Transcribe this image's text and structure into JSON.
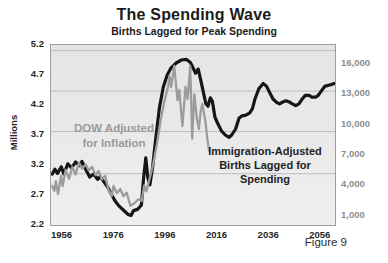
{
  "header": {
    "title": "The Spending Wave",
    "subtitle": "Births Lagged for Peak Spending"
  },
  "figure_label": "Figure 9",
  "annotations": {
    "dow_label": "DOW Adjusted for Inflation",
    "births_label": "Immigration-Adjusted Births Lagged for Spending"
  },
  "colors": {
    "births_line": "#161616",
    "dow_line": "#9c9c9c",
    "plot_background": "#e9e9e9",
    "gridline": "#bcbcbc",
    "right_axis_text": "#8c8c8c",
    "axis_text": "#262626"
  },
  "chart_data": {
    "type": "line",
    "title": "The Spending Wave",
    "subtitle": "Births Lagged for Peak Spending",
    "x_range": [
      1951.5,
      2061.5
    ],
    "x_ticks": [
      "1956",
      "1976",
      "1996",
      "2016",
      "2036",
      "2056"
    ],
    "x_tick_years": [
      1956,
      1976,
      1996,
      2016,
      2036,
      2056
    ],
    "y_left": {
      "label": "Millions",
      "range": [
        2.2,
        5.2
      ],
      "ticks": [
        "5.2",
        "4.7",
        "4.2",
        "3.7",
        "3.2",
        "2.7",
        "2.2"
      ]
    },
    "y_right": {
      "ticks": [
        "16,000",
        "13,000",
        "10,000",
        "7,000",
        "4,000",
        "1,000"
      ]
    },
    "grid_fractions": [
      0.031,
      0.256,
      0.481,
      0.715
    ],
    "legend_position": "in-plot text labels",
    "series": [
      {
        "name": "Immigration-Adjusted Births Lagged for Spending",
        "color": "#161616",
        "stroke_width": 3.2,
        "points": [
          [
            1952,
            3.05
          ],
          [
            1953,
            3.13
          ],
          [
            1954,
            3.06
          ],
          [
            1955.5,
            3.17
          ],
          [
            1956.5,
            3.05
          ],
          [
            1958,
            3.22
          ],
          [
            1959.5,
            3.15
          ],
          [
            1961,
            3.25
          ],
          [
            1962.5,
            3.19
          ],
          [
            1963.5,
            3.26
          ],
          [
            1965,
            3.12
          ],
          [
            1966.5,
            3.0
          ],
          [
            1968,
            3.05
          ],
          [
            1969.5,
            2.96
          ],
          [
            1970.5,
            3.01
          ],
          [
            1972,
            2.92
          ],
          [
            1973.5,
            2.83
          ],
          [
            1975,
            2.7
          ],
          [
            1976.5,
            2.59
          ],
          [
            1978,
            2.51
          ],
          [
            1980,
            2.43
          ],
          [
            1981.5,
            2.37
          ],
          [
            1982.5,
            2.36
          ],
          [
            1983.5,
            2.44
          ],
          [
            1985,
            2.46
          ],
          [
            1986.5,
            2.53
          ],
          [
            1987.3,
            2.95
          ],
          [
            1988.2,
            3.32
          ],
          [
            1989,
            2.99
          ],
          [
            1989.8,
            2.87
          ],
          [
            1990.8,
            3.15
          ],
          [
            1992,
            3.62
          ],
          [
            1993.5,
            4.15
          ],
          [
            1995,
            4.5
          ],
          [
            1996.5,
            4.7
          ],
          [
            1998,
            4.82
          ],
          [
            2000,
            4.9
          ],
          [
            2002,
            4.95
          ],
          [
            2004,
            4.96
          ],
          [
            2005.5,
            4.91
          ],
          [
            2006.5,
            4.82
          ],
          [
            2007.5,
            4.73
          ],
          [
            2008.5,
            4.8
          ],
          [
            2009.5,
            4.62
          ],
          [
            2010.5,
            4.42
          ],
          [
            2011.5,
            4.22
          ],
          [
            2012.3,
            4.18
          ],
          [
            2013.2,
            4.32
          ],
          [
            2014,
            4.26
          ],
          [
            2015,
            4.0
          ],
          [
            2016,
            3.9
          ],
          [
            2017.5,
            3.77
          ],
          [
            2019,
            3.7
          ],
          [
            2020.5,
            3.66
          ],
          [
            2021.5,
            3.7
          ],
          [
            2023,
            3.8
          ],
          [
            2024.3,
            3.98
          ],
          [
            2025.5,
            4.02
          ],
          [
            2027,
            4.03
          ],
          [
            2028.5,
            4.07
          ],
          [
            2029.5,
            4.14
          ],
          [
            2030.5,
            4.3
          ],
          [
            2032,
            4.47
          ],
          [
            2033.7,
            4.56
          ],
          [
            2035,
            4.51
          ],
          [
            2036.3,
            4.4
          ],
          [
            2037.5,
            4.3
          ],
          [
            2039,
            4.24
          ],
          [
            2040,
            4.22
          ],
          [
            2041.3,
            4.25
          ],
          [
            2042.5,
            4.27
          ],
          [
            2043.8,
            4.25
          ],
          [
            2045,
            4.22
          ],
          [
            2046.3,
            4.19
          ],
          [
            2047.5,
            4.22
          ],
          [
            2048.8,
            4.3
          ],
          [
            2050,
            4.36
          ],
          [
            2051.5,
            4.36
          ],
          [
            2052.5,
            4.33
          ],
          [
            2054,
            4.33
          ],
          [
            2055,
            4.36
          ],
          [
            2056.3,
            4.44
          ],
          [
            2057.5,
            4.51
          ],
          [
            2059,
            4.53
          ],
          [
            2060,
            4.54
          ],
          [
            2061.3,
            4.56
          ]
        ]
      },
      {
        "name": "DOW Adjusted for Inflation",
        "color": "#9c9c9c",
        "stroke_width": 2.3,
        "points": [
          [
            1952,
            2.85
          ],
          [
            1952.8,
            2.77
          ],
          [
            1953.4,
            2.93
          ],
          [
            1954.2,
            2.72
          ],
          [
            1955.4,
            3.02
          ],
          [
            1956,
            2.85
          ],
          [
            1957.2,
            3.12
          ],
          [
            1958.5,
            2.97
          ],
          [
            1959.8,
            3.17
          ],
          [
            1961,
            3.04
          ],
          [
            1962.3,
            3.24
          ],
          [
            1963.6,
            3.14
          ],
          [
            1964.9,
            3.21
          ],
          [
            1966.1,
            3.11
          ],
          [
            1967.4,
            3.17
          ],
          [
            1968.7,
            3.03
          ],
          [
            1969.9,
            3.1
          ],
          [
            1971.2,
            2.96
          ],
          [
            1972.5,
            3.02
          ],
          [
            1973.7,
            2.8
          ],
          [
            1975,
            2.68
          ],
          [
            1975.7,
            2.85
          ],
          [
            1977,
            2.73
          ],
          [
            1978.3,
            2.8
          ],
          [
            1979.6,
            2.68
          ],
          [
            1980.8,
            2.74
          ],
          [
            1982.3,
            2.52
          ],
          [
            1984,
            2.57
          ],
          [
            1985.3,
            2.63
          ],
          [
            1986.6,
            2.6
          ],
          [
            1987.6,
            2.86
          ],
          [
            1988.4,
            2.76
          ],
          [
            1989.7,
            2.97
          ],
          [
            1991,
            3.2
          ],
          [
            1992.5,
            3.55
          ],
          [
            1994,
            3.95
          ],
          [
            1995.5,
            4.28
          ],
          [
            1996.8,
            4.5
          ],
          [
            1997.4,
            4.68
          ],
          [
            1998,
            4.5
          ],
          [
            1999.2,
            4.85
          ],
          [
            2000.5,
            4.28
          ],
          [
            2001.2,
            4.45
          ],
          [
            2002.4,
            3.85
          ],
          [
            2003.6,
            4.5
          ],
          [
            2004.4,
            4.3
          ],
          [
            2005.4,
            4.85
          ],
          [
            2006.2,
            3.64
          ],
          [
            2007,
            4.38
          ],
          [
            2008,
            3.97
          ],
          [
            2008.8,
            3.8
          ],
          [
            2009.5,
            4.1
          ],
          [
            2010.1,
            4.22
          ],
          [
            2010.8,
            4.05
          ],
          [
            2011.4,
            3.89
          ],
          [
            2012,
            3.66
          ],
          [
            2012.7,
            3.44
          ]
        ]
      }
    ]
  }
}
